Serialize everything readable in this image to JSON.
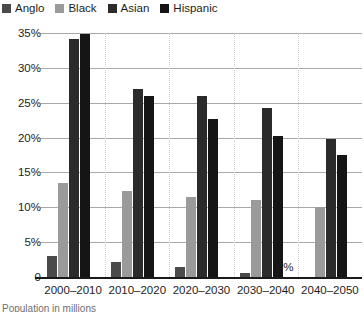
{
  "legend": {
    "position": "top-left",
    "items": [
      {
        "label": "Anglo",
        "color": "#4a4a4a"
      },
      {
        "label": "Black",
        "color": "#9a9a9a"
      },
      {
        "label": "Asian",
        "color": "#2b2b2b"
      },
      {
        "label": "Hispanic",
        "color": "#151515"
      }
    ]
  },
  "yaxis": {
    "ticks": [
      "35%",
      "30%",
      "25%",
      "20%",
      "15%",
      "10%",
      "5%",
      "0"
    ]
  },
  "annotations": {
    "zero_label": "0%"
  },
  "footnote": {
    "text": "Population in millions"
  },
  "chart_data": {
    "type": "bar",
    "title": "",
    "xlabel": "",
    "ylabel": "",
    "ylim": [
      0,
      35
    ],
    "ytick_values": [
      0,
      5,
      10,
      15,
      20,
      25,
      30,
      35
    ],
    "grid": true,
    "legend_position": "top-left",
    "categories": [
      "2000–2010",
      "2010–2020",
      "2020–2030",
      "2030–2040",
      "2040–2050"
    ],
    "series": [
      {
        "name": "Anglo",
        "color": "#4a4a4a",
        "values": [
          3.0,
          2.2,
          1.4,
          0.6,
          0.0
        ]
      },
      {
        "name": "Black",
        "color": "#9a9a9a",
        "values": [
          13.5,
          12.3,
          11.5,
          11.0,
          10.0
        ]
      },
      {
        "name": "Asian",
        "color": "#2b2b2b",
        "values": [
          34.2,
          27.0,
          26.0,
          24.3,
          19.8
        ]
      },
      {
        "name": "Hispanic",
        "color": "#151515",
        "values": [
          34.8,
          26.0,
          22.7,
          20.2,
          17.5
        ]
      }
    ],
    "data_labels": [
      {
        "category": "2040–2050",
        "series": "Anglo",
        "text": "0%"
      }
    ]
  }
}
